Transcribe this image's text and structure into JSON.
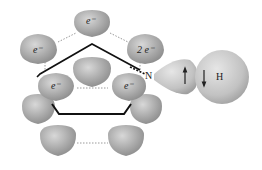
{
  "diagram": {
    "labels": {
      "top": "e⁻",
      "upper_left": "e⁻",
      "upper_right": "2 e⁻",
      "mid_left": "e⁻",
      "mid_right": "e⁻",
      "nitrogen": "N",
      "hydrogen": "H"
    },
    "colors": {
      "lobe": "#a8a8a8",
      "lobe_highlight": "#d4d4d4",
      "bond": "#111111",
      "dotted": "#9a9a9a"
    }
  }
}
